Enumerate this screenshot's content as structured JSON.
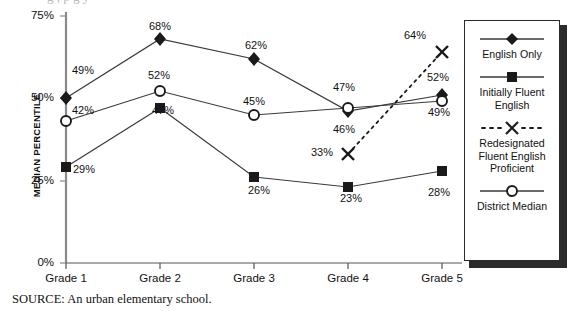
{
  "figure": {
    "source_note": "SOURCE: An urban elementary school.",
    "title_remnant": "g                ,                   p                  g                y"
  },
  "axes": {
    "y_title": "MEDIAN PERCENTILE",
    "y_ticks": [
      "75%",
      "50%",
      "25%",
      "0%"
    ],
    "x_ticks": [
      "Grade 1",
      "Grade 2",
      "Grade 3",
      "Grade 4",
      "Grade 5"
    ]
  },
  "legend": {
    "entries": [
      {
        "label": "English Only",
        "marker": "diamond-marker-icon",
        "line": "solid"
      },
      {
        "label": "Initially Fluent English",
        "marker": "square-marker-icon",
        "line": "solid"
      },
      {
        "label": "Redesignated Fluent English Proficient",
        "marker": "x-marker-icon",
        "line": "dashed"
      },
      {
        "label": "District Median",
        "marker": "circle-marker-icon",
        "line": "solid"
      }
    ]
  },
  "chart_data": {
    "type": "line",
    "title": "",
    "xlabel": "",
    "ylabel": "MEDIAN PERCENTILE",
    "categories": [
      "Grade 1",
      "Grade 2",
      "Grade 3",
      "Grade 4",
      "Grade 5"
    ],
    "ylim": [
      0,
      75
    ],
    "yticks": [
      0,
      25,
      50,
      75
    ],
    "grid": false,
    "legend_position": "right",
    "series": [
      {
        "name": "English Only",
        "marker": "diamond",
        "line": "solid",
        "values": [
          49,
          68,
          62,
          46,
          52
        ],
        "labels": [
          "49%",
          "68%",
          "62%",
          "46%",
          "52%"
        ]
      },
      {
        "name": "Initially Fluent English",
        "marker": "square",
        "line": "solid",
        "values": [
          29,
          47,
          26,
          23,
          28
        ],
        "labels": [
          "29%",
          "47%",
          "26%",
          "23%",
          "28%"
        ]
      },
      {
        "name": "Redesignated Fluent English Proficient",
        "marker": "x",
        "line": "dashed",
        "values": [
          null,
          null,
          null,
          33,
          64
        ],
        "labels": [
          "",
          "",
          "",
          "33%",
          "64%"
        ]
      },
      {
        "name": "District Median",
        "marker": "circle",
        "line": "solid",
        "values": [
          42,
          52,
          45,
          47,
          49
        ],
        "labels": [
          "42%",
          "52%",
          "45%",
          "47%",
          "49%"
        ]
      }
    ]
  },
  "value_labels": [
    {
      "text": "49%",
      "x": 72,
      "y": 64
    },
    {
      "text": "68%",
      "x": 149,
      "y": 20
    },
    {
      "text": "62%",
      "x": 245,
      "y": 39
    },
    {
      "text": "46%",
      "x": 333,
      "y": 123
    },
    {
      "text": "52%",
      "x": 427,
      "y": 71
    },
    {
      "text": "42%",
      "x": 72,
      "y": 104
    },
    {
      "text": "52%",
      "x": 148,
      "y": 69
    },
    {
      "text": "45%",
      "x": 243,
      "y": 95
    },
    {
      "text": "47%",
      "x": 333,
      "y": 81
    },
    {
      "text": "49%",
      "x": 428,
      "y": 106
    },
    {
      "text": "29%",
      "x": 73,
      "y": 163
    },
    {
      "text": "47%",
      "x": 152,
      "y": 104
    },
    {
      "text": "26%",
      "x": 248,
      "y": 184
    },
    {
      "text": "23%",
      "x": 340,
      "y": 192
    },
    {
      "text": "28%",
      "x": 428,
      "y": 186
    },
    {
      "text": "33%",
      "x": 311,
      "y": 146
    },
    {
      "text": "64%",
      "x": 404,
      "y": 29
    }
  ]
}
